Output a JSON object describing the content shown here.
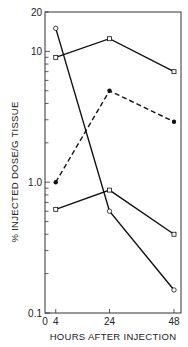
{
  "chart_data": {
    "type": "line",
    "title": "",
    "xlabel": "HOURS AFTER INJECTION",
    "ylabel": "% INJECTED DOSE/G TISSUE",
    "yscale": "log",
    "xlim": [
      0,
      49
    ],
    "ylim": [
      0.1,
      20
    ],
    "x_ticks": [
      0,
      4,
      24,
      48
    ],
    "x_tick_labels": [
      "0",
      "4",
      "24",
      "48"
    ],
    "y_ticks": [
      0.1,
      1.0,
      10,
      20
    ],
    "y_tick_labels": [
      "0.1",
      "1.0",
      "10",
      "20"
    ],
    "grid": false,
    "legend": null,
    "x": [
      4,
      24,
      48
    ],
    "series": [
      {
        "name": "series-open-circle",
        "marker": "open-circle",
        "line": "solid",
        "values": [
          15,
          0.6,
          0.15
        ]
      },
      {
        "name": "series-open-triangle",
        "marker": "open-small",
        "line": "solid",
        "values": [
          9,
          12.5,
          7
        ]
      },
      {
        "name": "series-filled-circle",
        "marker": "filled-circle",
        "line": "dashed",
        "values": [
          1.0,
          5,
          2.9
        ]
      },
      {
        "name": "series-open-square",
        "marker": "open-square",
        "line": "solid",
        "values": [
          0.62,
          0.87,
          0.4
        ]
      }
    ]
  }
}
